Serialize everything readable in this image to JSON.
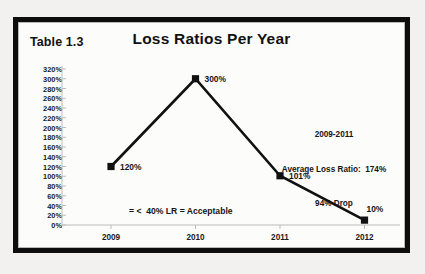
{
  "figure": {
    "table_label": "Table 1.3",
    "title": "Loss Ratios Per Year"
  },
  "annotations": {
    "threshold_note": "= <  40% LR = Acceptable",
    "summary_line1": "2009-2011",
    "summary_line2": "Average Loss Ratio:  174%",
    "summary_line3": "94% Drop"
  },
  "colors": {
    "frame": "#0d0d0d",
    "series": "#111111",
    "axis": "#bdbdbd",
    "background": "#fcfcfb"
  },
  "chart_data": {
    "type": "line",
    "title": "Loss Ratios Per Year",
    "xlabel": "",
    "ylabel": "",
    "categories": [
      "2009",
      "2010",
      "2011",
      "2012"
    ],
    "values": [
      120,
      300,
      101,
      10
    ],
    "point_labels": [
      "120%",
      "300%",
      "101%",
      "10%"
    ],
    "ylim": [
      0,
      320
    ],
    "ytick_values": [
      320,
      300,
      280,
      260,
      240,
      220,
      200,
      180,
      160,
      140,
      120,
      100,
      80,
      60,
      40,
      20,
      0
    ],
    "ytick_labels": [
      "320%",
      "300%",
      "280%",
      "260%",
      "240%",
      "220%",
      "200%",
      "180%",
      "160%",
      "140%",
      "120%",
      "100%",
      "80%",
      "60%",
      "40%",
      "20%",
      "0%"
    ],
    "grid": false,
    "legend": false,
    "marker": "square",
    "series_name": "Loss Ratio"
  }
}
